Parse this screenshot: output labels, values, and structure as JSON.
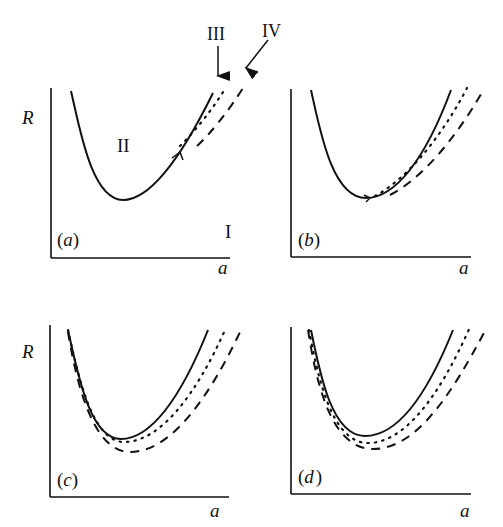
{
  "figure": {
    "panels": [
      {
        "id": "a",
        "label": "(a)",
        "label_letter": "a",
        "y_axis": "R",
        "x_axis": "a",
        "region_labels": {
          "upper": "II",
          "lower": "I"
        },
        "arrows": [
          {
            "label": "III",
            "target": "dotted curve"
          },
          {
            "label": "IV",
            "target": "dashed curve"
          }
        ]
      },
      {
        "id": "b",
        "label": "(b)",
        "label_letter": "b",
        "y_axis": "",
        "x_axis": "a"
      },
      {
        "id": "c",
        "label": "(c)",
        "label_letter": "c",
        "y_axis": "R",
        "x_axis": "a"
      },
      {
        "id": "d",
        "label": "(d)",
        "label_letter": "d",
        "y_axis": "",
        "x_axis": "a"
      }
    ],
    "text": {
      "R": "R",
      "a": "a",
      "II": "II",
      "I": "I",
      "III": "III",
      "IV": "IV",
      "paren_open": "(",
      "paren_close": ")",
      "letter_a": "a",
      "letter_b": "b",
      "letter_c": "c",
      "letter_d": "d"
    },
    "curve_styles": {
      "solid": "boundary curve",
      "dotted": "curve III",
      "dashed": "curve IV"
    },
    "colors": {
      "ink": "#111111",
      "background": "#ffffff"
    }
  }
}
